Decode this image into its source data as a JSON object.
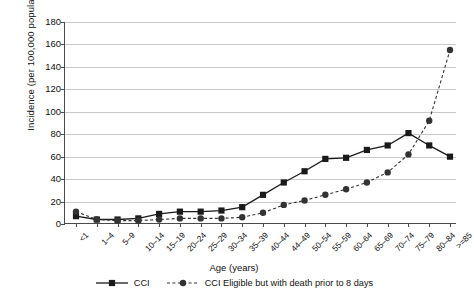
{
  "chart_data": {
    "type": "line",
    "title": "",
    "xlabel": "Age (years)",
    "ylabel": "Incidence (per 100,000 population)",
    "ylim": [
      0,
      180
    ],
    "ytick_step": 20,
    "yticks": [
      0,
      20,
      40,
      60,
      80,
      100,
      120,
      140,
      160,
      180
    ],
    "grid": true,
    "legend_position": "bottom",
    "categories": [
      "<1",
      "1–4",
      "5–9",
      "10–14",
      "15–19",
      "20–24",
      "25–29",
      "30–34",
      "35–39",
      "40–44",
      "44–49",
      "50–54",
      "55–59",
      "60–64",
      "65–69",
      "70–74",
      "75–79",
      "80–84",
      ">=85"
    ],
    "series": [
      {
        "name": "CCI",
        "marker": "square",
        "linestyle": "solid",
        "color": "#1a1a1a",
        "values": [
          7,
          4,
          4,
          5,
          9,
          11,
          11,
          12,
          15,
          26,
          37,
          47,
          58,
          59,
          66,
          70,
          81,
          70,
          60
        ]
      },
      {
        "name": "CCI Eligible but with death prior to 8 days",
        "marker": "circle",
        "linestyle": "dashed",
        "color": "#333333",
        "values": [
          11,
          4,
          3,
          3,
          4,
          5,
          5,
          5,
          6,
          10,
          17,
          21,
          26,
          31,
          37,
          46,
          62,
          92,
          155
        ]
      }
    ]
  },
  "legend": {
    "items": [
      {
        "label": "CCI"
      },
      {
        "label": "CCI Eligible but with death prior to 8 days"
      }
    ]
  }
}
